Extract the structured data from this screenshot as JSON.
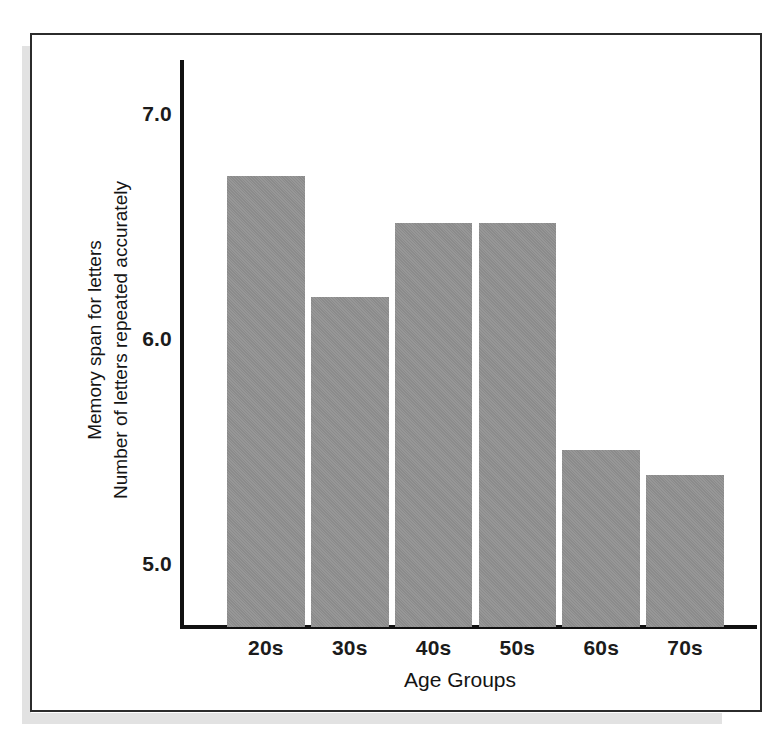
{
  "figure": {
    "frame_color": "#2b2b2b",
    "background": "#ffffff",
    "bar_color": "#919191",
    "axis_color": "#111111"
  },
  "chart_data": {
    "type": "bar",
    "title": "",
    "subtitle": "",
    "xlabel": "Age Groups",
    "ylabel": "Memory span for letters\nNumber of letters repeated accurately",
    "ylabel_line1": "Memory span for letters",
    "ylabel_line2": "Number of letters repeated accurately",
    "categories": [
      "20s",
      "30s",
      "40s",
      "50s",
      "60s",
      "70s"
    ],
    "values": [
      6.73,
      6.19,
      6.52,
      6.52,
      5.51,
      5.4
    ],
    "ylim": [
      4.7,
      7.25
    ],
    "ytick_labels": [
      "7.0",
      "6.0",
      "5.0"
    ],
    "ytick_values": [
      7.0,
      6.0,
      5.0
    ],
    "grid": false,
    "legend": null,
    "legend_position": "none",
    "annotations": []
  }
}
